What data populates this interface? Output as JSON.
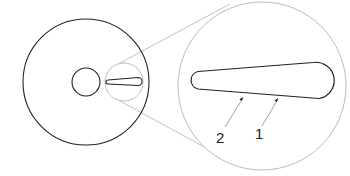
{
  "diagram": {
    "labels": {
      "one": "1",
      "two": "2"
    },
    "colors": {
      "outline": "#222222",
      "magnifier": "#bbbbbb",
      "background": "#ffffff"
    }
  }
}
